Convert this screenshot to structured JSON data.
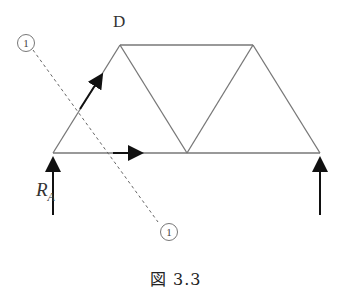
{
  "node_label_d": "D",
  "reaction_label": {
    "main": "R",
    "sub": "A"
  },
  "section_marker_top": "1",
  "section_marker_bottom": "1",
  "caption": "図 3.3",
  "colors": {
    "member": "#777777",
    "arrow": "#111111",
    "section_line": "#666666"
  }
}
